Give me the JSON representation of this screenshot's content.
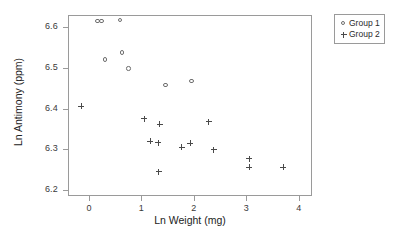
{
  "chart_data": {
    "type": "scatter",
    "title": "",
    "xlabel": "Ln Weight (mg)",
    "ylabel": "Ln Antimony (ppm)",
    "xlim": [
      -0.4,
      4.25
    ],
    "ylim": [
      6.185,
      6.63
    ],
    "xticks": [
      "0",
      "1",
      "2",
      "3",
      "4"
    ],
    "xtick_values": [
      0,
      1,
      2,
      3,
      4
    ],
    "yticks": [
      "6.2",
      "6.3",
      "6.4",
      "6.5",
      "6.6"
    ],
    "ytick_values": [
      6.2,
      6.3,
      6.4,
      6.5,
      6.6
    ],
    "grid": false,
    "legend_position": "outside-top-right",
    "series": [
      {
        "name": "Group 1",
        "marker": "circle-open",
        "color": "#6e6e6e",
        "points": [
          {
            "x": 0.17,
            "y": 6.614
          },
          {
            "x": 0.25,
            "y": 6.614
          },
          {
            "x": 0.6,
            "y": 6.616
          },
          {
            "x": 0.31,
            "y": 6.519
          },
          {
            "x": 0.64,
            "y": 6.537
          },
          {
            "x": 0.76,
            "y": 6.497
          },
          {
            "x": 1.47,
            "y": 6.456
          },
          {
            "x": 1.96,
            "y": 6.466
          }
        ]
      },
      {
        "name": "Group 2",
        "marker": "plus",
        "color": "#4a4a4a",
        "points": [
          {
            "x": -0.15,
            "y": 6.406
          },
          {
            "x": 1.05,
            "y": 6.375
          },
          {
            "x": 1.35,
            "y": 6.361
          },
          {
            "x": 1.17,
            "y": 6.32
          },
          {
            "x": 1.32,
            "y": 6.316
          },
          {
            "x": 1.33,
            "y": 6.245
          },
          {
            "x": 1.77,
            "y": 6.305
          },
          {
            "x": 1.93,
            "y": 6.315
          },
          {
            "x": 2.28,
            "y": 6.367
          },
          {
            "x": 2.38,
            "y": 6.299
          },
          {
            "x": 3.05,
            "y": 6.277
          },
          {
            "x": 3.05,
            "y": 6.256
          },
          {
            "x": 3.7,
            "y": 6.256
          }
        ]
      }
    ]
  },
  "legend": {
    "entries": [
      {
        "label": "Group 1",
        "marker": "circle-open"
      },
      {
        "label": "Group 2",
        "marker": "plus"
      }
    ]
  }
}
